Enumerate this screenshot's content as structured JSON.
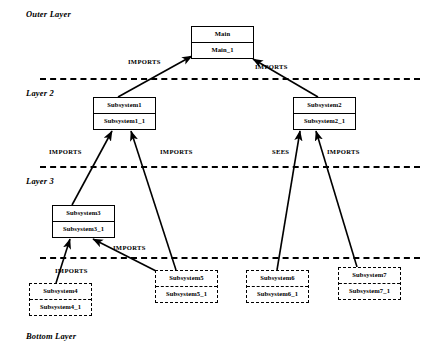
{
  "diagram": {
    "background": "#ffffff",
    "stroke": "#000000",
    "layers": [
      {
        "id": "outer",
        "label": "Outer Layer",
        "x": 26,
        "y": 9,
        "divider_y": 78
      },
      {
        "id": "layer2",
        "label": "Layer 2",
        "x": 26,
        "y": 88,
        "divider_y": 166
      },
      {
        "id": "layer3",
        "label": "Layer 3",
        "x": 26,
        "y": 176,
        "divider_y": 257
      },
      {
        "id": "bottom",
        "label": "Bottom Layer",
        "x": 26,
        "y": 331,
        "divider_y": null
      }
    ],
    "divider_x_start": 40,
    "divider_x_end": 420,
    "modules": [
      {
        "id": "main",
        "top": "Main",
        "bottom": "Main_1",
        "x": 191,
        "y": 26,
        "w": 63,
        "h": 33,
        "style": "solid"
      },
      {
        "id": "subsystem1",
        "top": "Subsystem1",
        "bottom": "Subsystem1_1",
        "x": 93,
        "y": 97,
        "w": 63,
        "h": 33,
        "style": "solid"
      },
      {
        "id": "subsystem2",
        "top": "Subsystem2",
        "bottom": "Subsystem2_1",
        "x": 293,
        "y": 97,
        "w": 63,
        "h": 33,
        "style": "solid"
      },
      {
        "id": "subsystem3",
        "top": "Subsystem3",
        "bottom": "Subsystem3_1",
        "x": 52,
        "y": 205,
        "w": 63,
        "h": 33,
        "style": "solid"
      },
      {
        "id": "subsystem4",
        "top": "Subsystem4",
        "bottom": "Subsystem4_1",
        "x": 29,
        "y": 283,
        "w": 63,
        "h": 33,
        "style": "dashed"
      },
      {
        "id": "subsystem5",
        "top": "Subsystem5",
        "bottom": "Subsystem5_1",
        "x": 155,
        "y": 270,
        "w": 63,
        "h": 33,
        "style": "dashed"
      },
      {
        "id": "subsystem6",
        "top": "Subsystem6",
        "bottom": "Subsystem6_1",
        "x": 246,
        "y": 270,
        "w": 63,
        "h": 33,
        "style": "dashed"
      },
      {
        "id": "subsystem7",
        "top": "Subsystem7",
        "bottom": "Subsystem7_1",
        "x": 338,
        "y": 267,
        "w": 63,
        "h": 33,
        "style": "dashed"
      }
    ],
    "edges": [
      {
        "id": "e1",
        "from": "subsystem1",
        "to": "main",
        "relation": "IMPORTS",
        "x1": 118,
        "y1": 97,
        "x2": 192,
        "y2": 56,
        "label_x": 128,
        "label_y": 58
      },
      {
        "id": "e2",
        "from": "subsystem2",
        "to": "main",
        "relation": "IMPORTS",
        "x1": 318,
        "y1": 97,
        "x2": 253,
        "y2": 59,
        "label_x": 255,
        "label_y": 63
      },
      {
        "id": "e3",
        "from": "subsystem3",
        "to": "subsystem1",
        "relation": "IMPORTS",
        "x1": 72,
        "y1": 205,
        "x2": 112,
        "y2": 131,
        "label_x": 49,
        "label_y": 148
      },
      {
        "id": "e4",
        "from": "subsystem5",
        "to": "subsystem1",
        "relation": "IMPORTS",
        "x1": 176,
        "y1": 270,
        "x2": 131,
        "y2": 131,
        "label_x": 160,
        "label_y": 148
      },
      {
        "id": "e5",
        "from": "subsystem6",
        "to": "subsystem2",
        "relation": "SEES",
        "x1": 277,
        "y1": 270,
        "x2": 300,
        "y2": 131,
        "label_x": 272,
        "label_y": 148
      },
      {
        "id": "e6",
        "from": "subsystem7",
        "to": "subsystem2",
        "relation": "IMPORTS",
        "x1": 357,
        "y1": 267,
        "x2": 316,
        "y2": 131,
        "label_x": 327,
        "label_y": 148
      },
      {
        "id": "e7",
        "from": "subsystem4",
        "to": "subsystem3",
        "relation": "IMPORTS",
        "x1": 56,
        "y1": 283,
        "x2": 70,
        "y2": 239,
        "label_x": 55,
        "label_y": 267
      },
      {
        "id": "e8",
        "from": "subsystem5",
        "to": "subsystem3",
        "relation": "IMPORTS",
        "x1": 158,
        "y1": 272,
        "x2": 93,
        "y2": 239,
        "label_x": 113,
        "label_y": 244
      }
    ]
  }
}
